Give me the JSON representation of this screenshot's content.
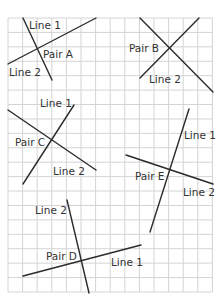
{
  "grid": {
    "x0": 8,
    "y0": 18,
    "cols": 14,
    "rows": 19,
    "cell_w": 14.6,
    "cell_h": 14.42,
    "color": "#d4d4d4"
  },
  "line_color": "#2b2b2b",
  "pairs": [
    {
      "name": "Pair A",
      "label": {
        "text": "Pair A",
        "x": 43,
        "y": 58
      },
      "lines": [
        {
          "name": "Line 1",
          "x1": 23,
          "y1": 18,
          "x2": 52,
          "y2": 80,
          "label": {
            "text": "Line 1",
            "x": 29,
            "y": 29
          }
        },
        {
          "name": "Line 2",
          "x1": 8,
          "y1": 64,
          "x2": 96,
          "y2": 18,
          "label": {
            "text": "Line 2",
            "x": 9,
            "y": 76
          }
        }
      ]
    },
    {
      "name": "Pair B",
      "label": {
        "text": "Pair B",
        "x": 129,
        "y": 52
      },
      "lines": [
        {
          "name": "Line 1",
          "x1": 140,
          "y1": 18,
          "x2": 213,
          "y2": 92,
          "label": null
        },
        {
          "name": "Line 2",
          "x1": 140,
          "y1": 78,
          "x2": 199,
          "y2": 18,
          "label": {
            "text": "Line 2",
            "x": 149,
            "y": 83
          }
        }
      ]
    },
    {
      "name": "Pair C",
      "label": {
        "text": "Pair C",
        "x": 15,
        "y": 146
      },
      "lines": [
        {
          "name": "Line 1",
          "x1": 74,
          "y1": 105,
          "x2": 23,
          "y2": 184,
          "label": {
            "text": "Line 1",
            "x": 40,
            "y": 107
          }
        },
        {
          "name": "Line 2",
          "x1": 8,
          "y1": 110,
          "x2": 96,
          "y2": 170,
          "label": {
            "text": "Line 2",
            "x": 53,
            "y": 175
          }
        }
      ]
    },
    {
      "name": "Pair D",
      "label": {
        "text": "Pair D",
        "x": 46,
        "y": 260
      },
      "lines": [
        {
          "name": "Line 1",
          "x1": 23,
          "y1": 276,
          "x2": 141,
          "y2": 245,
          "label": {
            "text": "Line 1",
            "x": 111,
            "y": 266
          }
        },
        {
          "name": "Line 2",
          "x1": 67,
          "y1": 200,
          "x2": 89,
          "y2": 293,
          "label": {
            "text": "Line 2",
            "x": 35,
            "y": 214
          }
        }
      ]
    },
    {
      "name": "Pair E",
      "label": {
        "text": "Pair E",
        "x": 135,
        "y": 180
      },
      "lines": [
        {
          "name": "Line 1",
          "x1": 189,
          "y1": 109,
          "x2": 150,
          "y2": 232,
          "label": {
            "text": "Line 1",
            "x": 184,
            "y": 139
          }
        },
        {
          "name": "Line 2",
          "x1": 126,
          "y1": 155,
          "x2": 213,
          "y2": 184,
          "label": {
            "text": "Line 2",
            "x": 183,
            "y": 196
          }
        }
      ]
    }
  ]
}
